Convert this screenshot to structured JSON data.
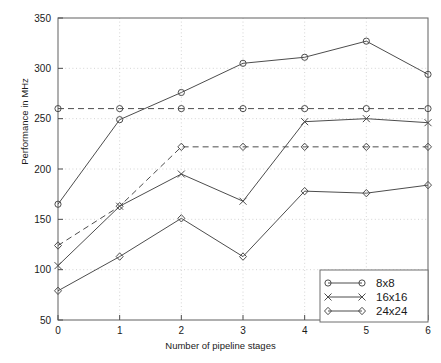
{
  "chart_data": {
    "type": "line",
    "title": "",
    "xlabel": "Number of pipeline stages",
    "ylabel": "Performance in MHz",
    "x": [
      0,
      1,
      2,
      3,
      4,
      5,
      6
    ],
    "xlim": [
      0,
      6
    ],
    "ylim": [
      50,
      350
    ],
    "xticks": [
      "0",
      "1",
      "2",
      "3",
      "4",
      "5",
      "6"
    ],
    "yticks": [
      "50",
      "100",
      "150",
      "200",
      "250",
      "300",
      "350"
    ],
    "grid": true,
    "grid_style": "dotted",
    "legend_position": "lower right",
    "series": [
      {
        "name": "8x8",
        "marker": "circle",
        "linestyle": "solid",
        "color": "#4d4d4d",
        "values": [
          165,
          249,
          276,
          305,
          311,
          327,
          294
        ]
      },
      {
        "name": "16x16",
        "marker": "x",
        "linestyle": "solid",
        "color": "#4d4d4d",
        "values": [
          104,
          163,
          195,
          168,
          247,
          250,
          246
        ]
      },
      {
        "name": "24x24",
        "marker": "diamond",
        "linestyle": "solid",
        "color": "#4d4d4d",
        "values": [
          79,
          113,
          151,
          113,
          178,
          176,
          184
        ]
      },
      {
        "name": "8x8-reference",
        "marker": "circle",
        "linestyle": "dashed",
        "color": "#4d4d4d",
        "values": [
          260,
          260,
          260,
          260,
          260,
          260,
          260
        ]
      },
      {
        "name": "24x24-reference",
        "marker": "diamond",
        "linestyle": "dashed",
        "color": "#4d4d4d",
        "values": [
          124,
          163,
          222,
          222,
          222,
          222,
          222
        ]
      }
    ],
    "legend": [
      {
        "label": "8x8",
        "marker": "circle"
      },
      {
        "label": "16x16",
        "marker": "x"
      },
      {
        "label": "24x24",
        "marker": "diamond"
      }
    ]
  }
}
